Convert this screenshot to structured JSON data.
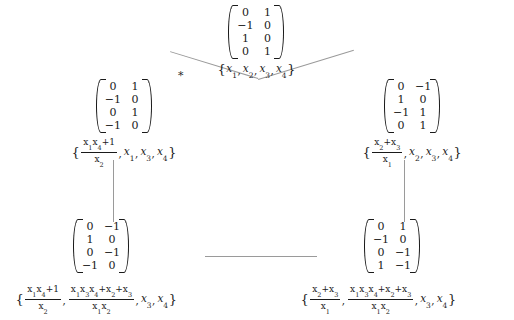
{
  "diagram": {
    "type": "mutation-exchange-graph",
    "title": "",
    "edge_marker": "*",
    "nodes": [
      {
        "id": "root",
        "name": "root-node",
        "matrix": [
          [
            "0",
            "1"
          ],
          [
            "−1",
            "0"
          ],
          [
            "1",
            "0"
          ],
          [
            "0",
            "1"
          ]
        ],
        "cluster": {
          "text": "{x₁, x₂, x₃, x₄}",
          "items": [
            {
              "kind": "var",
              "base": "x",
              "sub": "1"
            },
            {
              "kind": "var",
              "base": "x",
              "sub": "2"
            },
            {
              "kind": "var",
              "base": "x",
              "sub": "3"
            },
            {
              "kind": "var",
              "base": "x",
              "sub": "4"
            }
          ]
        }
      },
      {
        "id": "left",
        "name": "left-node",
        "matrix": [
          [
            "0",
            "1"
          ],
          [
            "−1",
            "0"
          ],
          [
            "0",
            "1"
          ],
          [
            "−1",
            "0"
          ]
        ],
        "cluster": {
          "text": "{(x₁x₄+1)/x₂, x₁, x₃, x₄}",
          "items": [
            {
              "kind": "frac",
              "num": "x₁x₄+1",
              "den": "x₂"
            },
            {
              "kind": "var",
              "base": "x",
              "sub": "1"
            },
            {
              "kind": "var",
              "base": "x",
              "sub": "3"
            },
            {
              "kind": "var",
              "base": "x",
              "sub": "4"
            }
          ]
        }
      },
      {
        "id": "right",
        "name": "right-node",
        "matrix": [
          [
            "0",
            "−1"
          ],
          [
            "1",
            "0"
          ],
          [
            "−1",
            "1"
          ],
          [
            "0",
            "1"
          ]
        ],
        "cluster": {
          "text": "{(x₂+x₃)/x₁, x₂, x₃, x₄}",
          "items": [
            {
              "kind": "frac",
              "num": "x₂+x₃",
              "den": "x₁"
            },
            {
              "kind": "var",
              "base": "x",
              "sub": "2"
            },
            {
              "kind": "var",
              "base": "x",
              "sub": "3"
            },
            {
              "kind": "var",
              "base": "x",
              "sub": "4"
            }
          ]
        }
      },
      {
        "id": "bottom-left",
        "name": "bottom-left-node",
        "matrix": [
          [
            "0",
            "−1"
          ],
          [
            "1",
            "0"
          ],
          [
            "0",
            "−1"
          ],
          [
            "−1",
            "0"
          ]
        ],
        "cluster": {
          "text": "{(x₁x₄+1)/x₂, (x₁x₃x₄+x₂+x₃)/(x₁x₂), x₃, x₄}",
          "items": [
            {
              "kind": "frac",
              "num": "x₁x₄+1",
              "den": "x₂"
            },
            {
              "kind": "frac",
              "num": "x₁x₃x₄+x₂+x₃",
              "den": "x₁x₂"
            },
            {
              "kind": "var",
              "base": "x",
              "sub": "3"
            },
            {
              "kind": "var",
              "base": "x",
              "sub": "4"
            }
          ]
        }
      },
      {
        "id": "bottom-right",
        "name": "bottom-right-node",
        "matrix": [
          [
            "0",
            "1"
          ],
          [
            "−1",
            "0"
          ],
          [
            "0",
            "−1"
          ],
          [
            "1",
            "−1"
          ]
        ],
        "cluster": {
          "text": "{(x₂+x₃)/x₁, (x₁x₃x₄+x₂+x₃)/(x₁x₂), x₃, x₄}",
          "items": [
            {
              "kind": "frac",
              "num": "x₂+x₃",
              "den": "x₁"
            },
            {
              "kind": "frac",
              "num": "x₁x₃x₄+x₂+x₃",
              "den": "x₁x₂"
            },
            {
              "kind": "var",
              "base": "x",
              "sub": "3"
            },
            {
              "kind": "var",
              "base": "x",
              "sub": "4"
            }
          ]
        }
      }
    ],
    "edges": [
      {
        "from": "root",
        "to": "left",
        "style": "diagonal",
        "label": "*"
      },
      {
        "from": "root",
        "to": "right",
        "style": "diagonal",
        "label": ""
      },
      {
        "from": "left",
        "to": "bottom-left",
        "style": "vertical",
        "label": ""
      },
      {
        "from": "right",
        "to": "bottom-right",
        "style": "vertical",
        "label": ""
      },
      {
        "from": "bottom-left",
        "to": "bottom-right",
        "style": "horizontal",
        "label": ""
      }
    ],
    "colors": {
      "ink": "#1a1a1a",
      "edge": "#9a9a9a",
      "background": "#ffffff"
    }
  }
}
